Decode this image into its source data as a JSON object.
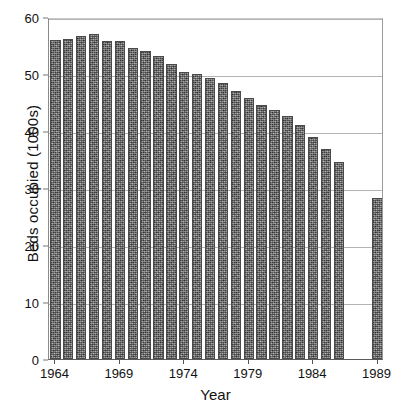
{
  "chart_data": {
    "type": "bar",
    "title": "",
    "xlabel": "Year",
    "ylabel": "Beds occupied (1000s)",
    "ylim": [
      0,
      60
    ],
    "yticks": [
      0,
      10,
      20,
      30,
      40,
      50,
      60
    ],
    "ytick_labels": [
      "0",
      "10",
      "20",
      "30",
      "40",
      "50",
      "60"
    ],
    "xtick_labels": [
      "1964",
      "1969",
      "1974",
      "1979",
      "1984",
      "1989"
    ],
    "xtick_categories": [
      "1964",
      "1969",
      "1974",
      "1979",
      "1984",
      "1989"
    ],
    "grid": "horizontal",
    "legend": "none",
    "bar_color": "#6d6d6d",
    "categories": [
      "1964",
      "1965",
      "1966",
      "1967",
      "1968",
      "1969",
      "1970",
      "1971",
      "1972",
      "1973",
      "1974",
      "1975",
      "1976",
      "1977",
      "1978",
      "1979",
      "1980",
      "1981",
      "1982",
      "1983",
      "1984",
      "1985",
      "1986",
      "1987",
      "1988",
      "1989"
    ],
    "values": [
      56.0,
      56.2,
      56.7,
      57.0,
      55.8,
      55.8,
      54.5,
      54.0,
      53.2,
      51.8,
      50.4,
      50.0,
      49.3,
      48.5,
      47.0,
      45.8,
      44.6,
      43.6,
      42.6,
      41.0,
      39.0,
      36.8,
      34.5,
      null,
      null,
      28.2
    ]
  }
}
